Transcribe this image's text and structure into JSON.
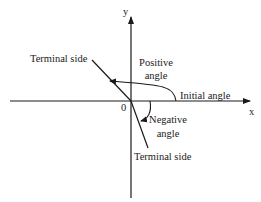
{
  "diagram": {
    "type": "angle-direction-diagram",
    "axes": {
      "x_label": "x",
      "y_label": "y",
      "origin_label": "0"
    },
    "labels": {
      "terminal_side_upper": "Terminal side",
      "positive_angle_line1": "Positive",
      "positive_angle_line2": "angle",
      "initial_angle": "Initial angle",
      "negative_angle_line1": "Negative",
      "negative_angle_line2": "angle",
      "terminal_side_lower": "Terminal side"
    },
    "colors": {
      "line": "#1a1a1a",
      "background": "#ffffff"
    }
  }
}
